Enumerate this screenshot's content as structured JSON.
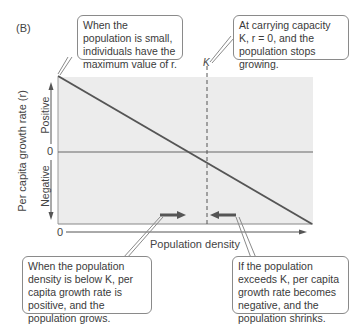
{
  "panel_label": "(B)",
  "axes": {
    "y_label": "Per capita growth rate (r)",
    "y_positive": "Positive",
    "y_negative": "Negative",
    "y_zero": "0",
    "x_zero": "0",
    "x_label": "Population density",
    "k_label": "K"
  },
  "callouts": {
    "top_left": "When the population is small, individuals have the maximum value of r.",
    "top_right": "At carrying capacity K, r = 0, and the population stops growing.",
    "bottom_left": "When the population density is below K, per capita growth rate is positive, and the population grows.",
    "bottom_right": "If the population exceeds K, per capita growth rate becomes negative, and the population shrinks."
  },
  "colors": {
    "plot_fill": "#ececec",
    "line": "#555555",
    "arrow": "#555555",
    "border": "#8a8a8a"
  }
}
